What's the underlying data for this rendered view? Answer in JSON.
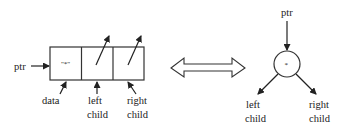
{
  "diagram": {
    "left": {
      "ptr_label": "ptr",
      "data_value": "\"*\"",
      "labels": {
        "data": "data",
        "left_line1": "left",
        "left_line2": "child",
        "right_line1": "right",
        "right_line2": "child"
      }
    },
    "equivalence_arrow": "double-headed-arrow",
    "right": {
      "ptr_label": "ptr",
      "node_value": "*",
      "left_line1": "left",
      "left_line2": "child",
      "right_line1": "right",
      "right_line2": "child"
    },
    "colors": {
      "stroke": "#222222",
      "background": "#ffffff"
    }
  }
}
